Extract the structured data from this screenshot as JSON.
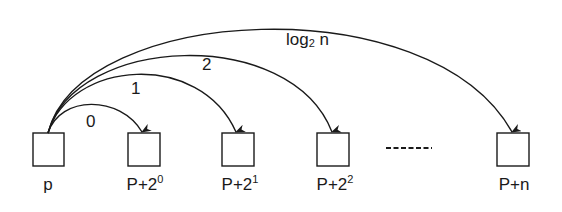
{
  "diagram": {
    "title": "",
    "colors": {
      "stroke": "#1a1a1a",
      "background": "#ffffff"
    },
    "nodes": [
      {
        "id": "p",
        "label_base": "p",
        "label_sup": "",
        "x": 33,
        "y": 133,
        "w": 31,
        "h": 33,
        "cx": 48
      },
      {
        "id": "p_plus_2_0",
        "label_base": "P+2",
        "label_sup": "0",
        "x": 128,
        "y": 133,
        "w": 32,
        "h": 33,
        "cx": 144
      },
      {
        "id": "p_plus_2_1",
        "label_base": "P+2",
        "label_sup": "1",
        "x": 222,
        "y": 133,
        "w": 32,
        "h": 33,
        "cx": 238
      },
      {
        "id": "p_plus_2_2",
        "label_base": "P+2",
        "label_sup": "2",
        "x": 317,
        "y": 133,
        "w": 32,
        "h": 33,
        "cx": 333
      },
      {
        "id": "p_plus_n",
        "label_base": "P+n",
        "label_sup": "",
        "x": 497,
        "y": 133,
        "w": 32,
        "h": 33,
        "cx": 513
      }
    ],
    "ellipsis": {
      "type": "dashed-line",
      "x1": 386,
      "x2": 432,
      "y": 148
    },
    "arcs": [
      {
        "from": "p",
        "to": "p_plus_2_0",
        "label": "0",
        "label_sub": "",
        "label_x": 88,
        "label_y": 112
      },
      {
        "from": "p",
        "to": "p_plus_2_1",
        "label": "1",
        "label_sub": "",
        "label_x": 133,
        "label_y": 80
      },
      {
        "from": "p",
        "to": "p_plus_2_2",
        "label": "2",
        "label_sub": "",
        "label_x": 202,
        "label_y": 56
      },
      {
        "from": "p",
        "to": "p_plus_n",
        "label_pre": "log",
        "label_sub": "2",
        "label_post": " n",
        "label_x": 286,
        "label_y": 30
      }
    ],
    "labels": {
      "node_0": {
        "base": "p",
        "sup": ""
      },
      "node_1": {
        "base": "P+2",
        "sup": "0"
      },
      "node_2": {
        "base": "P+2",
        "sup": "1"
      },
      "node_3": {
        "base": "P+2",
        "sup": "2"
      },
      "node_4": {
        "base": "P+n",
        "sup": ""
      },
      "arc_0": "0",
      "arc_1": "1",
      "arc_2": "2",
      "arc_3_pre": "log",
      "arc_3_sub": "2",
      "arc_3_post": " n"
    }
  }
}
